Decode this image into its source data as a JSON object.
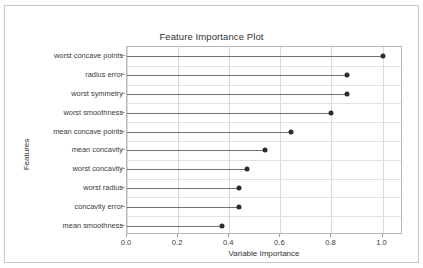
{
  "notebook": {
    "prompt": "[12]",
    "code": "plot_model(tuned_ridge, \"feature\")"
  },
  "chart_data": {
    "type": "bar",
    "title": "Feature Importance Plot",
    "xlabel": "Variable Importance",
    "ylabel": "Features",
    "xlim": [
      0.0,
      1.08
    ],
    "grid": true,
    "legend": null,
    "xticks": [
      "0.0",
      "0.2",
      "0.4",
      "0.6",
      "0.8",
      "1.0"
    ],
    "xtick_values": [
      0.0,
      0.2,
      0.4,
      0.6,
      0.8,
      1.0
    ],
    "categories": [
      "worst concave points",
      "radius error",
      "worst symmetry",
      "worst smoothness",
      "mean concave points",
      "mean concavity",
      "worst concavity",
      "worst radius",
      "concavity error",
      "mean smoothness"
    ],
    "values": [
      1.0,
      0.86,
      0.86,
      0.8,
      0.64,
      0.54,
      0.47,
      0.44,
      0.44,
      0.37
    ],
    "marker_color": "#2b2b2b",
    "stem_color": "#6f6f6f"
  }
}
